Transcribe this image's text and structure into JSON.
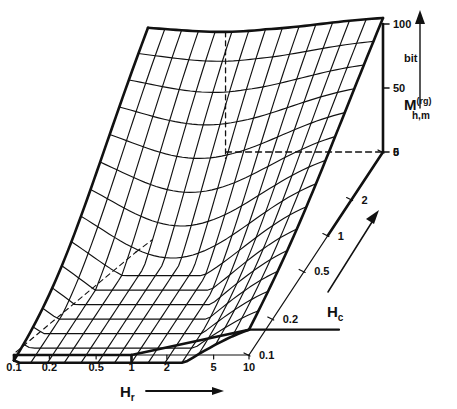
{
  "figure": {
    "kind": "3d-surface-wireframe",
    "background": "#ffffff",
    "ink": "#111111"
  },
  "chart_data": {
    "type": "surface",
    "title": "",
    "subtitle": "",
    "xlabel": "H_r",
    "ylabel": "H_c",
    "zlabel": "M_h,m^(rg)",
    "zunit": "bit",
    "grid": true,
    "legend": false,
    "projection": "oblique-3d",
    "x": {
      "name": "H_r",
      "scale": "log",
      "ticks": [
        "0.1",
        "0.2",
        "0.5",
        "1",
        "2",
        "5",
        "10"
      ],
      "tick_values": [
        0.1,
        0.2,
        0.5,
        1,
        2,
        5,
        10
      ],
      "range": [
        0.1,
        10
      ],
      "arrow": true
    },
    "y": {
      "name": "H_c",
      "scale": "log",
      "ticks": [
        "0.1",
        "0.2",
        "0.5",
        "1",
        "2",
        "5"
      ],
      "tick_values": [
        0.1,
        0.2,
        0.5,
        1,
        2,
        5
      ],
      "range": [
        0.1,
        5
      ],
      "arrow": true
    },
    "z": {
      "name": "M",
      "sub": "h,m",
      "sup": "(rg)",
      "unit": "bit",
      "ticks": [
        "100",
        "50",
        "0"
      ],
      "tick_values": [
        100,
        50,
        0
      ],
      "range": [
        0,
        100
      ],
      "arrow": true
    },
    "surface_description": "Saddle / valley shaped wireframe rising toward both far corners with a minimum in the interior",
    "mesh": {
      "nx": 14,
      "ny": 14
    },
    "corner_values": {
      "front_left_xmin_ymin": 22,
      "front_right_xmax_ymin": 30,
      "back_left_xmin_ymax": 96,
      "back_right_xmax_ymax": 100,
      "interior_minimum": 0
    },
    "reference_lines": [
      {
        "name": "zero-level-dashed",
        "value": 0,
        "style": "dashed"
      },
      {
        "name": "back-corner-vertical-dashed",
        "style": "dashed"
      },
      {
        "name": "floor-diagonal-dashed",
        "style": "dashed"
      }
    ]
  },
  "labels": {
    "x_axis_name": "H",
    "x_axis_sub": "r",
    "y_axis_name": "H",
    "y_axis_sub": "c",
    "z_axis_name": "M",
    "z_axis_sub": "h,m",
    "z_axis_sup": "(rg)",
    "z_unit": "bit",
    "x_ticks": [
      "0.1",
      "0.2",
      "0.5",
      "1",
      "2",
      "5",
      "10"
    ],
    "y_ticks": [
      "0.1",
      "0.2",
      "0.5",
      "1",
      "2",
      "5"
    ],
    "z_ticks": [
      "100",
      "50",
      "0"
    ]
  }
}
